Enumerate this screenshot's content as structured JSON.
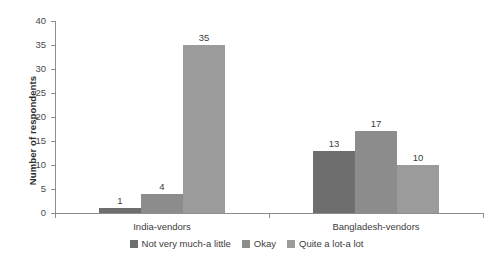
{
  "chart_data": {
    "type": "bar",
    "title": "",
    "subtitle": "",
    "xlabel": "",
    "ylabel": "Number of respondents",
    "categories": [
      "India-vendors",
      "Bangladesh-vendors"
    ],
    "series": [
      {
        "name": "Not very much-a little",
        "values": [
          1,
          13
        ],
        "color": "#6e6e6e"
      },
      {
        "name": "Okay",
        "values": [
          4,
          17
        ],
        "color": "#8c8c8c"
      },
      {
        "name": "Quite a lot-a lot",
        "values": [
          35,
          10
        ],
        "color": "#9b9b9b"
      }
    ],
    "ylim": [
      0,
      40
    ],
    "ytick_step": 5,
    "yticks": [
      0,
      5,
      10,
      15,
      20,
      25,
      30,
      35,
      40
    ],
    "ytick_labels": [
      "0",
      "5",
      "10",
      "15",
      "20",
      "25",
      "30",
      "35",
      "40"
    ],
    "data_labels": [
      [
        "1",
        "4",
        "35"
      ],
      [
        "13",
        "17",
        "10"
      ]
    ],
    "grid": false,
    "legend_position": "bottom",
    "grouped": true,
    "bar_gap_within_group": 0,
    "axis_color": "#8d8d8d",
    "background": "#ffffff"
  },
  "axes": {
    "y_title": "Number of respondents"
  },
  "legend": {
    "items": [
      {
        "label": "Not very much-a little",
        "color": "#6e6e6e"
      },
      {
        "label": "Okay",
        "color": "#8c8c8c"
      },
      {
        "label": "Quite a lot-a lot",
        "color": "#9b9b9b"
      }
    ]
  }
}
